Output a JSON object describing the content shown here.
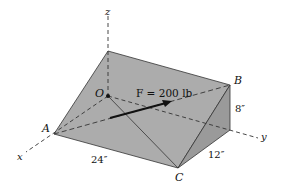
{
  "figure": {
    "type": "3D wedge statics diagram",
    "axes": {
      "x": "x",
      "y": "y",
      "z": "z"
    },
    "points": {
      "origin": "O",
      "a": "A",
      "b": "B",
      "c": "C"
    },
    "force_label": "F = 200 lb",
    "dimensions": {
      "length": "24″",
      "width": "12″",
      "height": "8″"
    },
    "colors": {
      "top_face": "#a9a9a9",
      "side_face": "#959595",
      "end_face": "#b4b4b4",
      "line": "#222222"
    }
  }
}
